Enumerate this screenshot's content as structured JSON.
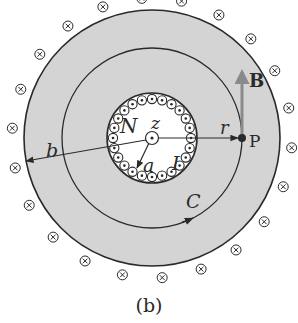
{
  "figure": {
    "caption": "(b)",
    "labels": {
      "N": "N",
      "z": "z",
      "a": "a",
      "I": "I",
      "r": "r",
      "P": "P",
      "B": "B",
      "b": "b",
      "C": "C"
    },
    "geometry": {
      "center": [
        152,
        138
      ],
      "outer_radius": 128,
      "loop_radius": 90,
      "solenoid_radius": 45,
      "outer_marker_radius": 140,
      "outer_marker_count": 22,
      "inner_marker_count": 24
    },
    "colors": {
      "shading": "#d4d4d4",
      "stroke": "#2a2a2a",
      "field_arrow": "#8a8a8a",
      "background": "#ffffff"
    },
    "markers": {
      "outer": "current-into-page (⊗)",
      "inner": "current-out-of-page (⊙)"
    }
  }
}
